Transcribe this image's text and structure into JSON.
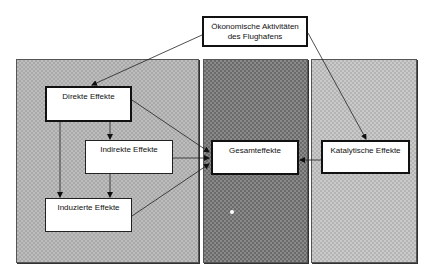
{
  "diagram": {
    "top_node": {
      "line1": "Ökonomische Aktivitäten",
      "line2": "des Flughafens"
    },
    "nodes": {
      "direkte": "Direkte Effekte",
      "indirekte": "Indirekte Effekte",
      "induzierte": "Induzierte Effekte",
      "gesamt": "Gesamteffekte",
      "katalytisch": "Katalytische Effekte"
    },
    "panels": [
      {
        "name": "left",
        "color": "#bdbdbd"
      },
      {
        "name": "middle",
        "color": "#8a8a8a"
      },
      {
        "name": "right",
        "color": "#cacaca"
      }
    ],
    "edges": [
      {
        "from": "Ökonomische Aktivitäten des Flughafens",
        "to": "Direkte Effekte"
      },
      {
        "from": "Ökonomische Aktivitäten des Flughafens",
        "to": "Katalytische Effekte"
      },
      {
        "from": "Direkte Effekte",
        "to": "Indirekte Effekte"
      },
      {
        "from": "Direkte Effekte",
        "to": "Induzierte Effekte"
      },
      {
        "from": "Indirekte Effekte",
        "to": "Induzierte Effekte"
      },
      {
        "from": "Direkte Effekte",
        "to": "Gesamteffekte"
      },
      {
        "from": "Indirekte Effekte",
        "to": "Gesamteffekte"
      },
      {
        "from": "Induzierte Effekte",
        "to": "Gesamteffekte"
      },
      {
        "from": "Katalytische Effekte",
        "to": "Gesamteffekte"
      }
    ]
  }
}
